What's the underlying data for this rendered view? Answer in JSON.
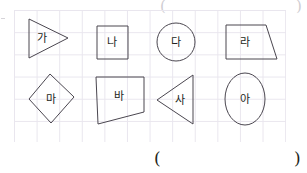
{
  "worksheet": {
    "title": "Geometric shapes labeled with Korean syllables on grid paper",
    "grid": {
      "visible": true,
      "cell_size_px": 22,
      "line_color": "#e9e6ee",
      "left": 14,
      "top": 10,
      "width": 272,
      "height": 132
    },
    "stroke_color": "#4a464f",
    "text_color": "#231f20"
  },
  "shapes": [
    {
      "id": "shape-ga",
      "label": "가",
      "type": "triangle-right",
      "points": "29,19 29,58 68,38",
      "label_x": 42,
      "label_y": 38
    },
    {
      "id": "shape-na",
      "label": "나",
      "type": "square",
      "points": "97,26 128,26 128,59 97,59",
      "label_x": 112,
      "label_y": 42
    },
    {
      "id": "shape-da",
      "label": "다",
      "type": "circle",
      "cx": 176,
      "cy": 42,
      "r": 19,
      "label_x": 176,
      "label_y": 42
    },
    {
      "id": "shape-ra",
      "label": "라",
      "type": "trapezoid",
      "points": "226,25 266,25 277,59 226,59",
      "label_x": 245,
      "label_y": 42
    },
    {
      "id": "shape-ma",
      "label": "마",
      "type": "rhombus",
      "points": "50,74 74,97 51,123 29,99",
      "label_x": 51,
      "label_y": 99
    },
    {
      "id": "shape-ba",
      "label": "바",
      "type": "quadrilateral",
      "points": "96,77 144,77 144,112 98,124",
      "label_x": 119,
      "label_y": 96
    },
    {
      "id": "shape-sa",
      "label": "사",
      "type": "triangle-left",
      "points": "193,75 193,124 157,100",
      "label_x": 180,
      "label_y": 100
    },
    {
      "id": "shape-a",
      "label": "아",
      "type": "ellipse",
      "cx": 245,
      "cy": 99,
      "rx": 20,
      "ry": 26,
      "label_x": 245,
      "label_y": 99
    }
  ],
  "answer_row": {
    "open_paren": "(",
    "close_paren": ")"
  },
  "top_marks": {
    "open_paren": "(",
    "close_paren": ")"
  }
}
